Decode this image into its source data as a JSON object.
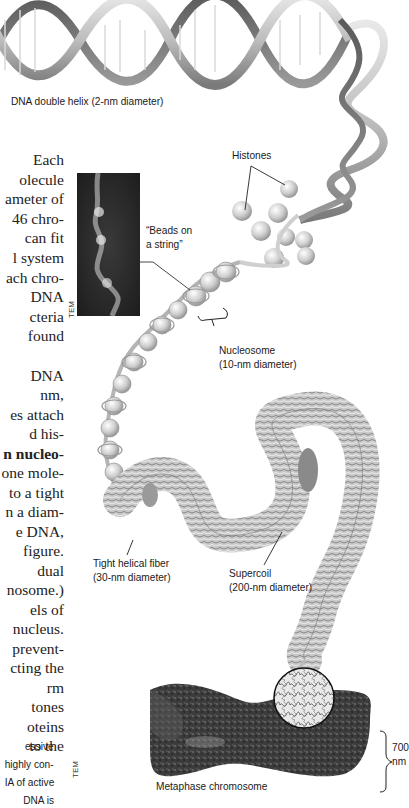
{
  "figure": {
    "labels": {
      "dna_helix": "DNA double helix (2-nm diameter)",
      "histones": "Histones",
      "beads_on_string": [
        "“Beads on",
        "a string”"
      ],
      "nucleosome": [
        "Nucleosome",
        "(10-nm diameter)"
      ],
      "tight_helical_fiber": [
        "Tight helical fiber",
        "(30-nm diameter)"
      ],
      "supercoil": [
        "Supercoil",
        "(200-nm diameter)"
      ],
      "metaphase_chromosome": "Metaphase chromosome",
      "scale_700": [
        "700",
        "nm"
      ],
      "tem_top": "TEM",
      "tem_bottom": "TEM"
    }
  },
  "body_text": {
    "lines": [
      "Each",
      "olecule",
      "ameter of",
      "46 chro-",
      " can fit",
      "l system",
      "ach chro-",
      " DNA",
      "cteria",
      " found",
      "",
      "DNA",
      "nm,",
      "es attach",
      "d his-",
      "n nucleo-",
      "one mole-",
      "to a tight",
      "n a diam-",
      "e DNA,",
      " figure.",
      "dual",
      "nosome.)",
      "els of",
      " nucleus.",
      " prevent-",
      "cting the",
      "rm",
      "tones",
      "oteins",
      " to the"
    ]
  },
  "caption_text": {
    "lines": [
      "essive",
      "highly con-",
      "IA of active",
      " DNA is"
    ]
  }
}
